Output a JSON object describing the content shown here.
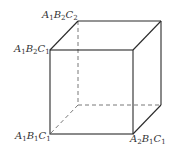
{
  "diagram": {
    "type": "cube",
    "vertices": {
      "front_top_left": {
        "x": 50,
        "y": 50
      },
      "front_top_right": {
        "x": 133,
        "y": 50
      },
      "front_bottom_left": {
        "x": 50,
        "y": 134
      },
      "front_bottom_right": {
        "x": 133,
        "y": 134
      },
      "back_top_left": {
        "x": 78,
        "y": 21
      },
      "back_top_right": {
        "x": 161,
        "y": 21
      },
      "back_bottom_left": {
        "x": 78,
        "y": 105
      },
      "back_bottom_right": {
        "x": 161,
        "y": 105
      }
    },
    "labels": [
      {
        "id": "back_top_left",
        "parts": [
          [
            "A",
            "1"
          ],
          [
            "B",
            "2"
          ],
          [
            "C",
            "2"
          ]
        ]
      },
      {
        "id": "front_top_left",
        "parts": [
          [
            "A",
            "1"
          ],
          [
            "B",
            "2"
          ],
          [
            "C",
            "1"
          ]
        ]
      },
      {
        "id": "front_bottom_left",
        "parts": [
          [
            "A",
            "1"
          ],
          [
            "B",
            "1"
          ],
          [
            "C",
            "1"
          ]
        ]
      },
      {
        "id": "front_bottom_right",
        "parts": [
          [
            "A",
            "2"
          ],
          [
            "B",
            "1"
          ],
          [
            "C",
            "1"
          ]
        ]
      }
    ],
    "label_text": {
      "back_top_left": "A1B2C2",
      "front_top_left": "A1B2C1",
      "front_bottom_left": "A1B1C1",
      "front_bottom_right": "A2B1C1"
    },
    "line_color": "#2a2a2a",
    "hidden_line_color": "#555555"
  }
}
